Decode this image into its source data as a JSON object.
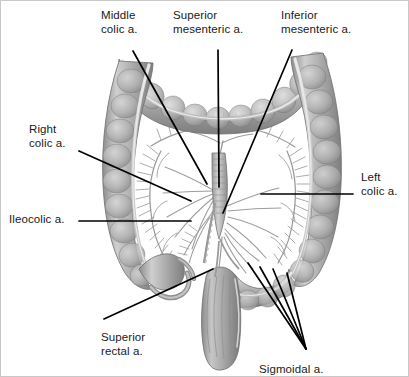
{
  "figure": {
    "background_color": "#ffffff",
    "border_color": "#c8c8c8",
    "label_color": "#1a1a1a",
    "leader_color": "#000000",
    "width": 409,
    "height": 377
  },
  "labels": [
    {
      "id": "middle-colic",
      "line1": "Middle",
      "line2": "colic a.",
      "x": 100,
      "y": 8,
      "align": "left"
    },
    {
      "id": "superior-mesenteric",
      "line1": "Superior",
      "line2": "mesenteric a.",
      "x": 172,
      "y": 8,
      "align": "left"
    },
    {
      "id": "inferior-mesenteric",
      "line1": "Inferior",
      "line2": "mesenteric a.",
      "x": 280,
      "y": 8,
      "align": "left"
    },
    {
      "id": "right-colic",
      "line1": "Right",
      "line2": "colic a.",
      "x": 28,
      "y": 122,
      "align": "left"
    },
    {
      "id": "ileocolic",
      "line1": "Ileocolic a.",
      "line2": "",
      "x": 8,
      "y": 212,
      "align": "left"
    },
    {
      "id": "left-colic",
      "line1": "Left",
      "line2": "colic a.",
      "x": 360,
      "y": 170,
      "align": "left"
    },
    {
      "id": "superior-rectal",
      "line1": "Superior",
      "line2": "rectal a.",
      "x": 100,
      "y": 330,
      "align": "left"
    },
    {
      "id": "sigmoidal",
      "line1": "Sigmoidal a.",
      "line2": "",
      "x": 258,
      "y": 362,
      "align": "left"
    }
  ],
  "leader_lines": [
    {
      "id": "leader-middle-colic",
      "x1": 132,
      "y1": 50,
      "x2": 206,
      "y2": 183
    },
    {
      "id": "leader-superior-mesenteric",
      "x1": 217,
      "y1": 49,
      "x2": 218,
      "y2": 186
    },
    {
      "id": "leader-inferior-mesenteric",
      "x1": 291,
      "y1": 49,
      "x2": 222,
      "y2": 212
    },
    {
      "id": "leader-right-colic",
      "x1": 78,
      "y1": 150,
      "x2": 190,
      "y2": 200
    },
    {
      "id": "leader-ileocolic",
      "x1": 78,
      "y1": 220,
      "x2": 190,
      "y2": 220
    },
    {
      "id": "leader-left-colic",
      "x1": 352,
      "y1": 193,
      "x2": 260,
      "y2": 193
    },
    {
      "id": "leader-superior-rectal",
      "x1": 103,
      "y1": 318,
      "x2": 212,
      "y2": 268
    },
    {
      "id": "leader-sigmoidal-1",
      "x1": 305,
      "y1": 348,
      "x2": 247,
      "y2": 262
    },
    {
      "id": "leader-sigmoidal-2",
      "x1": 305,
      "y1": 348,
      "x2": 259,
      "y2": 266
    },
    {
      "id": "leader-sigmoidal-3",
      "x1": 305,
      "y1": 348,
      "x2": 272,
      "y2": 268
    },
    {
      "id": "leader-sigmoidal-4",
      "x1": 305,
      "y1": 348,
      "x2": 286,
      "y2": 272
    }
  ],
  "anatomy": {
    "structures": [
      "transverse-colon",
      "ascending-colon",
      "descending-colon",
      "sigmoid-colon",
      "rectum",
      "cecum",
      "ileum",
      "mesenteric-vessels"
    ],
    "colon_fill_light": "#c9c9c9",
    "colon_fill_mid": "#a6a6a6",
    "colon_fill_dark": "#7c7c7c",
    "colon_outline": "#6b6b6b",
    "vessel_color": "#9a9a9a",
    "highlight": "#e2e2e2"
  }
}
